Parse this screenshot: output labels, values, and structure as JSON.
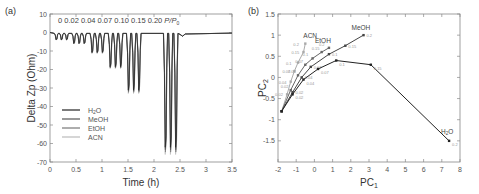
{
  "figure": {
    "panel_a_label": "(a)",
    "panel_b_label": "(b)"
  },
  "chart_data": [
    {
      "type": "line",
      "panel": "(a)",
      "title": "",
      "xlabel": "Time (h)",
      "ylabel": "Delta Zp (Ohm)",
      "xlim": [
        0,
        3.5
      ],
      "ylim": [
        -70,
        10
      ],
      "xticks": [
        "0",
        "0.5",
        "1",
        "1.5",
        "2",
        "2.5",
        "3",
        "3.5"
      ],
      "yticks": [
        "10",
        "0",
        "-10",
        "-20",
        "-30",
        "-40",
        "-50",
        "-60",
        "-70"
      ],
      "grid": false,
      "legend_position": "lower-left",
      "annotation": "0 0.02 0.04 0.07 0.10 0.15 0.20 P/P0",
      "pressure_steps": [
        "0",
        "0.02",
        "0.04",
        "0.07",
        "0.10",
        "0.15",
        "0.20"
      ],
      "pulse_depths_ohm": [
        -4,
        -8,
        -12,
        -19,
        -33,
        -64
      ],
      "pulse_start_times_h": [
        0.08,
        0.42,
        0.77,
        1.1,
        1.45,
        1.8,
        2.15
      ],
      "series": [
        {
          "name": "H2O",
          "label": "H₂O",
          "color": "#222222"
        },
        {
          "name": "MeOH",
          "label": "MeOH",
          "color": "#555555"
        },
        {
          "name": "EtOH",
          "label": "EtOH",
          "color": "#777777"
        },
        {
          "name": "ACN",
          "label": "ACN",
          "color": "#bbbbbb"
        }
      ]
    },
    {
      "type": "scatter",
      "panel": "(b)",
      "title": "",
      "xlabel": "PC1",
      "ylabel": "PC2",
      "xlim": [
        -2,
        8
      ],
      "ylim": [
        -2,
        1.5
      ],
      "xticks": [
        "-2",
        "-1",
        "0",
        "1",
        "2",
        "3",
        "4",
        "5",
        "6",
        "7",
        "8"
      ],
      "yticks": [
        "1.5",
        "1",
        "0.5",
        "0",
        "-0.5",
        "-1",
        "-1.5"
      ],
      "grid": false,
      "point_labels": [
        "0.02",
        "0.04",
        "0.07",
        "0.1",
        "0.15",
        "0.2"
      ],
      "series": [
        {
          "name": "H2O",
          "label": "H₂O",
          "color": "#222222",
          "x": [
            -1.8,
            -1.2,
            -0.6,
            0.2,
            1.2,
            3.1,
            7.4
          ],
          "y": [
            -0.8,
            -0.4,
            -0.05,
            0.2,
            0.4,
            0.3,
            -1.5
          ]
        },
        {
          "name": "MeOH",
          "label": "MeOH",
          "color": "#444444",
          "x": [
            -1.8,
            -1.2,
            -0.7,
            -0.2,
            0.8,
            1.7,
            2.7
          ],
          "y": [
            -0.8,
            -0.35,
            0.0,
            0.25,
            0.55,
            0.75,
            1.0
          ]
        },
        {
          "name": "EtOH",
          "label": "EtOH",
          "color": "#666666",
          "x": [
            -1.8,
            -1.3,
            -0.9,
            -0.5,
            -0.1,
            0.4,
            0.8
          ],
          "y": [
            -0.8,
            -0.3,
            0.05,
            0.3,
            0.45,
            0.6,
            0.7
          ]
        },
        {
          "name": "ACN",
          "label": "ACN",
          "color": "#aaaaaa",
          "x": [
            -1.8,
            -1.5,
            -1.3,
            -1.1,
            -0.9,
            -0.6,
            -0.5
          ],
          "y": [
            -0.8,
            -0.4,
            -0.1,
            0.15,
            0.35,
            0.6,
            0.8
          ]
        }
      ]
    }
  ]
}
